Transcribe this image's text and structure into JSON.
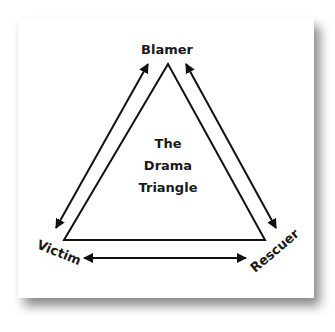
{
  "diagram": {
    "title_lines": [
      "The",
      "Drama",
      "Triangle"
    ],
    "vertices": {
      "top": "Blamer",
      "bottom_left": "Victim",
      "bottom_right": "Rescuer"
    },
    "arrows": [
      {
        "from": "Victim",
        "to": "Blamer",
        "type": "bidirectional"
      },
      {
        "from": "Blamer",
        "to": "Rescuer",
        "type": "bidirectional"
      },
      {
        "from": "Victim",
        "to": "Rescuer",
        "type": "bidirectional"
      }
    ],
    "colors": {
      "stroke": "#111111",
      "background": "#ffffff"
    }
  }
}
